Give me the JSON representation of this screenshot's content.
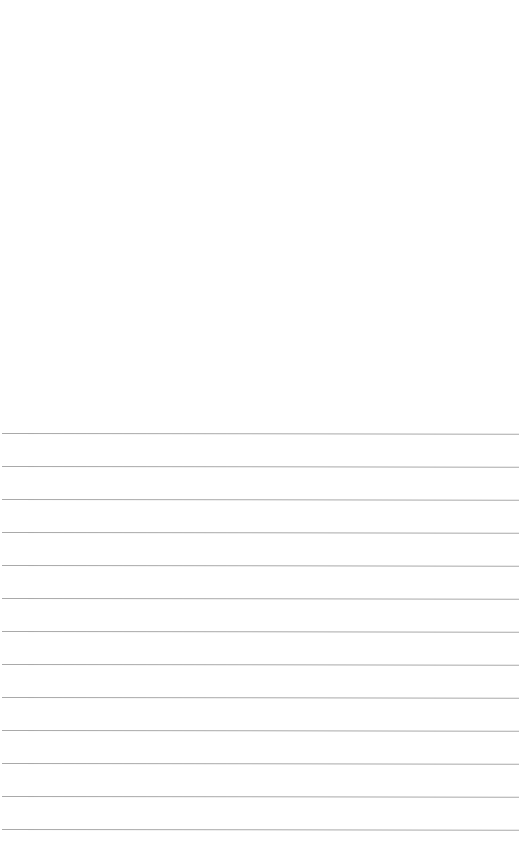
{
  "document": {
    "type": "lined-paper",
    "background_color": "#ffffff",
    "rule_color": "#a9a9a9",
    "rule_count": 13,
    "rule_spacing_px": 33,
    "rules": [
      {
        "y": 433
      },
      {
        "y": 466
      },
      {
        "y": 499
      },
      {
        "y": 532
      },
      {
        "y": 565
      },
      {
        "y": 598
      },
      {
        "y": 631
      },
      {
        "y": 664
      },
      {
        "y": 697
      },
      {
        "y": 730
      },
      {
        "y": 763
      },
      {
        "y": 796
      },
      {
        "y": 829
      }
    ]
  }
}
